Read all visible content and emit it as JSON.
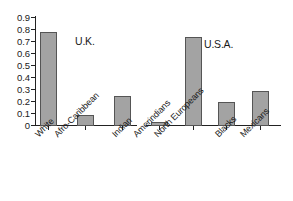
{
  "chart_data": {
    "type": "bar",
    "title": "",
    "subtitle": "",
    "xlabel": "",
    "ylabel": "",
    "ylim": [
      0,
      0.9
    ],
    "grid": false,
    "legend": "none",
    "categories": [
      "White",
      "Afro-Caribbean",
      "Indian",
      "Amerindians",
      "North Europeans",
      "Blacks",
      "Mexicans"
    ],
    "values": [
      0.78,
      0.09,
      0.25,
      0.03,
      0.745,
      0.2,
      0.29
    ],
    "ytick_labels": [
      "0.9",
      "0.8",
      "0.7",
      "0.6",
      "0.5",
      "0.4",
      "0.3",
      "0.2",
      "0.1",
      "0"
    ],
    "ytick_values": [
      0.9,
      0.8,
      0.7,
      0.6,
      0.5,
      0.4,
      0.3,
      0.2,
      0.1,
      0
    ],
    "annotations": [
      {
        "text": "U.K.",
        "group": "uk",
        "categories": [
          "White",
          "Afro-Caribbean",
          "Indian"
        ]
      },
      {
        "text": "U.S.A.",
        "group": "usa",
        "categories": [
          "Amerindians",
          "North Europeans",
          "Blacks",
          "Mexicans"
        ]
      }
    ],
    "bar_color": "#a3a3a3",
    "bar_edge_color": "#555555",
    "axis_color": "#222222",
    "background": "#ffffff"
  },
  "axis": {
    "ytick_labels": [
      "0.9",
      "0.8",
      "0.7",
      "0.6",
      "0.5",
      "0.4",
      "0.3",
      "0.2",
      "0.1",
      "0"
    ]
  },
  "bars": [
    {
      "label": "White",
      "value": 0.78
    },
    {
      "label": "Afro-Caribbean",
      "value": 0.09
    },
    {
      "label": "Indian",
      "value": 0.25
    },
    {
      "label": "Amerindians",
      "value": 0.03
    },
    {
      "label": "North Europeans",
      "value": 0.745
    },
    {
      "label": "Blacks",
      "value": 0.2
    },
    {
      "label": "Mexicans",
      "value": 0.29
    }
  ],
  "annotations": {
    "uk": "U.K.",
    "usa": "U.S.A."
  }
}
